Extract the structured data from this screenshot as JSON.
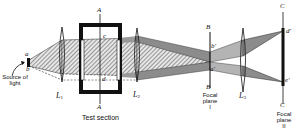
{
  "diagram": {
    "type": "schlieren optical system",
    "source": {
      "label": "Source of light",
      "point_labels": {
        "top": "a",
        "bottom": "b"
      }
    },
    "lenses": [
      {
        "id": "L1",
        "label": "L",
        "subscript": "1"
      },
      {
        "id": "L2",
        "label": "L",
        "subscript": "2"
      },
      {
        "id": "L3",
        "label": "L",
        "subscript": "3"
      }
    ],
    "test_section": {
      "caption": "Test section",
      "plane_label_top": "A",
      "plane_label_bottom": "A",
      "point_top": "c",
      "point_bottom": "d"
    },
    "focal_plane_1": {
      "label_top": "B",
      "label_bottom": "B",
      "caption_line1": "Focal",
      "caption_line2": "plane",
      "caption_line3": "I",
      "point_upper": "b'",
      "point_lower": "a'"
    },
    "focal_plane_2": {
      "label_top": "C",
      "label_bottom": "C",
      "caption_line1": "Focal",
      "caption_line2": "plane",
      "caption_line3": "II",
      "point_upper": "d'",
      "point_lower": "e'"
    },
    "colors": {
      "ink": "#111111",
      "shade_dark": "#8c8c8c",
      "shade_light": "#c4c4c4"
    }
  }
}
